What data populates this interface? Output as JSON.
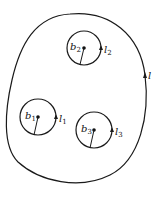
{
  "diagram": {
    "outer_curve": {
      "label": "l"
    },
    "circles": [
      {
        "id": "c1",
        "point_label": "b",
        "point_sub": "1",
        "curve_label": "l",
        "curve_sub": "1"
      },
      {
        "id": "c2",
        "point_label": "b",
        "point_sub": "2",
        "curve_label": "l",
        "curve_sub": "2"
      },
      {
        "id": "c3",
        "point_label": "b",
        "point_sub": "3",
        "curve_label": "l",
        "curve_sub": "3"
      }
    ],
    "colors": {
      "stroke": "#1a1a1a",
      "background": "#ffffff"
    }
  }
}
